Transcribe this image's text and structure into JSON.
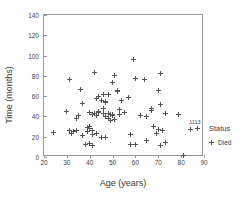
{
  "chart_data": {
    "type": "scatter",
    "title": "",
    "xlabel": "Age (years)",
    "ylabel": "Time (months)",
    "xlim": [
      20,
      90
    ],
    "ylim": [
      0,
      140
    ],
    "xticks": [
      20,
      30,
      40,
      50,
      60,
      70,
      80,
      90
    ],
    "yticks": [
      0,
      20,
      40,
      60,
      80,
      100,
      120,
      140
    ],
    "grid": false,
    "legend": {
      "title": "Status",
      "position": "right",
      "entries": [
        {
          "label": "Died",
          "marker": "plus-marker",
          "color": "#555555"
        }
      ]
    },
    "series": [
      {
        "name": "Died",
        "marker": "plus-marker",
        "color": "#555555",
        "points": [
          [
            24,
            24
          ],
          [
            30,
            45
          ],
          [
            31,
            76
          ],
          [
            31,
            26
          ],
          [
            32,
            23
          ],
          [
            33,
            25
          ],
          [
            34,
            38
          ],
          [
            34,
            26
          ],
          [
            35,
            41
          ],
          [
            36,
            67
          ],
          [
            37,
            53
          ],
          [
            37,
            21
          ],
          [
            38,
            12
          ],
          [
            39,
            29
          ],
          [
            39,
            25
          ],
          [
            40,
            44
          ],
          [
            40,
            30
          ],
          [
            40,
            28
          ],
          [
            40,
            13
          ],
          [
            41,
            42
          ],
          [
            41,
            26
          ],
          [
            41,
            22
          ],
          [
            41,
            11
          ],
          [
            42,
            43
          ],
          [
            42,
            83
          ],
          [
            43,
            58
          ],
          [
            43,
            41
          ],
          [
            43,
            23
          ],
          [
            44,
            60
          ],
          [
            44,
            45
          ],
          [
            44,
            44
          ],
          [
            45,
            56
          ],
          [
            45,
            19
          ],
          [
            46,
            62
          ],
          [
            46,
            48
          ],
          [
            46,
            43
          ],
          [
            47,
            54
          ],
          [
            47,
            55
          ],
          [
            47,
            40
          ],
          [
            47,
            19
          ],
          [
            48,
            62
          ],
          [
            48,
            43
          ],
          [
            48,
            38
          ],
          [
            49,
            42
          ],
          [
            49,
            36
          ],
          [
            50,
            73
          ],
          [
            50,
            42
          ],
          [
            50,
            41
          ],
          [
            51,
            80
          ],
          [
            51,
            37
          ],
          [
            52,
            66
          ],
          [
            52,
            65
          ],
          [
            53,
            47
          ],
          [
            53,
            42
          ],
          [
            54,
            56
          ],
          [
            55,
            44
          ],
          [
            57,
            59
          ],
          [
            58,
            22
          ],
          [
            58,
            12
          ],
          [
            59,
            96
          ],
          [
            60,
            12
          ],
          [
            60,
            77
          ],
          [
            62,
            41
          ],
          [
            64,
            76
          ],
          [
            65,
            40
          ],
          [
            65,
            16
          ],
          [
            67,
            48
          ],
          [
            67,
            46
          ],
          [
            68,
            30
          ],
          [
            69,
            23
          ],
          [
            70,
            66
          ],
          [
            70,
            27
          ],
          [
            71,
            82
          ],
          [
            71,
            52
          ],
          [
            71,
            11
          ],
          [
            72,
            26
          ],
          [
            73,
            43
          ],
          [
            73,
            14
          ],
          [
            79,
            42
          ],
          [
            81,
            1
          ],
          [
            84,
            27
          ],
          [
            87,
            28
          ]
        ]
      }
    ],
    "annotations": [
      {
        "text": "1113",
        "x": 86,
        "y": 32
      }
    ]
  }
}
